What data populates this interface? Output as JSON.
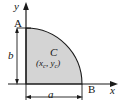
{
  "figure": {
    "background_color": "#ffffff",
    "region": {
      "fill_color": "#d4d4d4",
      "stroke_color": "#1a1a1a",
      "shape": "quarter-circle"
    },
    "axes": {
      "y_label": "y",
      "x_label": "x",
      "axis_color": "#1a1a1a"
    },
    "points": {
      "top_point_label": "A",
      "right_point_label": "B",
      "centroid_label": "C",
      "centroid_coords_open": "(",
      "centroid_coords_x": "x",
      "centroid_coords_x_sub": "c",
      "centroid_coords_sep": ", ",
      "centroid_coords_y": "y",
      "centroid_coords_y_sub": "c",
      "centroid_coords_close": ")"
    },
    "dimensions": {
      "vertical_label": "b",
      "horizontal_label": "a"
    }
  }
}
